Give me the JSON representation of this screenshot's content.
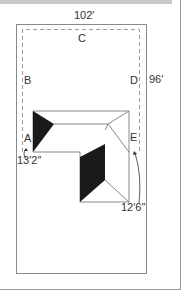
{
  "diagram": {
    "dimensions": {
      "lot_width": "102′",
      "lot_depth": "96′",
      "setback_a": "13′2″",
      "setback_e": "12′6″"
    },
    "points": {
      "a": "A",
      "b": "B",
      "c": "C",
      "d": "D",
      "e": "E"
    },
    "colors": {
      "lot_line": "#8a8a8a",
      "setback_line": "#9a9a9a",
      "building_line": "#888888",
      "roof_shade": "#1a1a1a",
      "frame": "#9a9a9a",
      "top_bar": "#c8c8c8"
    }
  }
}
